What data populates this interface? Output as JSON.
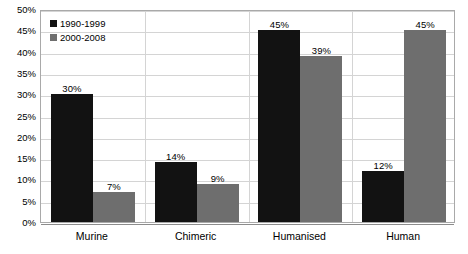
{
  "chart_data": {
    "type": "bar",
    "title": "",
    "subtitle": "",
    "xlabel": "",
    "ylabel": "",
    "categories": [
      "Murine",
      "Chimeric",
      "Humanised",
      "Human"
    ],
    "series": [
      {
        "name": "1990-1999",
        "color": "#121212",
        "values": [
          30,
          14,
          45,
          12
        ],
        "value_labels": [
          "30%",
          "14%",
          "45%",
          "12%"
        ]
      },
      {
        "name": "2000-2008",
        "color": "#6e6e6e",
        "values": [
          7,
          9,
          39,
          45
        ],
        "value_labels": [
          "7%",
          "9%",
          "39%",
          "45%"
        ]
      }
    ],
    "ylim": [
      0,
      50
    ],
    "ytick_step": 5,
    "ytick_labels": [
      "50%",
      "45%",
      "40%",
      "35%",
      "30%",
      "25%",
      "20%",
      "15%",
      "10%",
      "5%",
      "0%"
    ],
    "ytick_values": [
      50,
      45,
      40,
      35,
      30,
      25,
      20,
      15,
      10,
      5,
      0
    ],
    "grid": true,
    "grid_axis": "y",
    "legend_position": "top-left",
    "value_labels_shown": true,
    "plot_border": true,
    "background_color": "#ffffff"
  },
  "legend": {
    "entries": [
      {
        "label": "1990-1999",
        "swatch": "legend-swatch-black"
      },
      {
        "label": "2000-2008",
        "swatch": "legend-swatch-gray"
      }
    ]
  }
}
